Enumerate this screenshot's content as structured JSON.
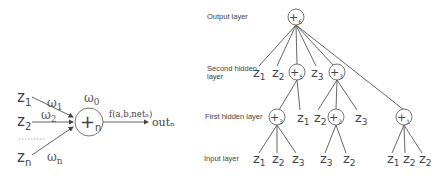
{
  "neuron": {
    "inputs": [
      {
        "name": "z",
        "sub": "1",
        "weight_sub": "1"
      },
      {
        "name": "z",
        "sub": "2",
        "weight_sub": "2"
      },
      {
        "name": "z",
        "sub": "n",
        "weight_sub": "n"
      }
    ],
    "bias": {
      "symbol": "ω",
      "sub": "0"
    },
    "weight_symbol": "ω",
    "node": {
      "symbol": "+",
      "sub": "n"
    },
    "function_label": "f(a,b,netₙ)",
    "output_label": "outₙ"
  },
  "tree": {
    "layers": {
      "output": "Output layer",
      "second_hidden_line1": "Second hidden",
      "second_hidden_line2": "layer",
      "first_hidden": "First hidden layer",
      "input": "Input layer"
    },
    "output_node": {
      "symbol": "+",
      "sub": "6"
    },
    "second_hidden": [
      {
        "type": "var",
        "name": "z",
        "sub": "1"
      },
      {
        "type": "var",
        "name": "z",
        "sub": "2"
      },
      {
        "type": "node",
        "symbol": "+",
        "sub": "5"
      },
      {
        "type": "var",
        "name": "z",
        "sub": "3"
      },
      {
        "type": "node",
        "symbol": "+",
        "sub": "3"
      }
    ],
    "first_hidden": [
      {
        "type": "node",
        "symbol": "+",
        "sub": "3"
      },
      {
        "type": "var",
        "name": "z",
        "sub": "1"
      },
      {
        "type": "var",
        "name": "z",
        "sub": "2"
      },
      {
        "type": "node",
        "symbol": "+",
        "sub": "2"
      },
      {
        "type": "var",
        "name": "z",
        "sub": "3"
      },
      {
        "type": "node",
        "symbol": "+",
        "sub": "1"
      }
    ],
    "inputs": [
      {
        "name": "z",
        "sub": "1"
      },
      {
        "name": "z",
        "sub": "2"
      },
      {
        "name": "z",
        "sub": "3"
      },
      {
        "name": "z",
        "sub": "3"
      },
      {
        "name": "z",
        "sub": "2"
      },
      {
        "name": "z",
        "sub": "1"
      },
      {
        "name": "z",
        "sub": "2"
      },
      {
        "name": "z",
        "sub": "2"
      }
    ]
  }
}
